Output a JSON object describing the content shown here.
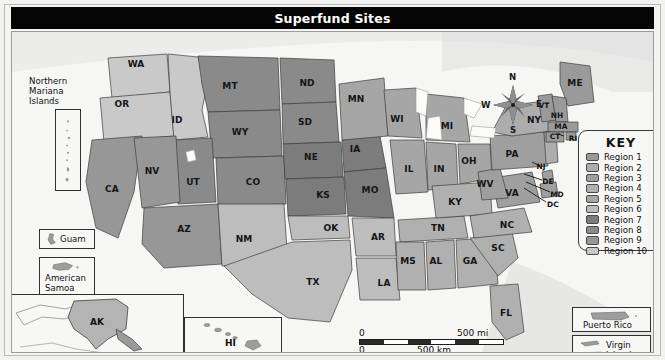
{
  "title": "Superfund Sites",
  "key": {
    "heading": "KEY",
    "entries": [
      {
        "label": "Region 1",
        "color": "#9a9a9a"
      },
      {
        "label": "Region 2",
        "color": "#adadad"
      },
      {
        "label": "Region 3",
        "color": "#9f9f9f"
      },
      {
        "label": "Region 4",
        "color": "#b0b0b0"
      },
      {
        "label": "Region 5",
        "color": "#a6a6a6"
      },
      {
        "label": "Region 6",
        "color": "#bdbdbd"
      },
      {
        "label": "Region 7",
        "color": "#7c7c7c"
      },
      {
        "label": "Region 8",
        "color": "#8a8a8a"
      },
      {
        "label": "Region 9",
        "color": "#979797"
      },
      {
        "label": "Region 10",
        "color": "#c9c9c9"
      }
    ]
  },
  "scale": {
    "miles_zero": "0",
    "miles_max": "500 mi",
    "km_zero": "0",
    "km_max": "500 km",
    "projection_line1": "Lambert Conformal",
    "projection_line2": "Conic Projection"
  },
  "compass": {
    "north": "N",
    "east": "E",
    "south": "S",
    "west": "W"
  },
  "insets": [
    {
      "name": "northern-mariana-islands",
      "label_line1": "Northern",
      "label_line2": "Mariana",
      "label_line3": "Islands"
    },
    {
      "name": "guam",
      "label_line1": "Guam"
    },
    {
      "name": "american-samoa",
      "label_line1": "American",
      "label_line2": "Samoa"
    },
    {
      "name": "alaska",
      "label_line1": "AK"
    },
    {
      "name": "hawaii",
      "label_line1": "HI"
    },
    {
      "name": "puerto-rico",
      "label_line1": "Puerto Rico"
    },
    {
      "name": "virgin-islands",
      "label_line1": "Virgin",
      "label_line2": "Islands"
    }
  ],
  "map": {
    "states": [
      {
        "abbr": "WA",
        "x": 124,
        "y": 32,
        "region": 10
      },
      {
        "abbr": "OR",
        "x": 110,
        "y": 72,
        "region": 10
      },
      {
        "abbr": "ID",
        "x": 165,
        "y": 88,
        "region": 10
      },
      {
        "abbr": "MT",
        "x": 218,
        "y": 54,
        "region": 8
      },
      {
        "abbr": "WY",
        "x": 228,
        "y": 100,
        "region": 8
      },
      {
        "abbr": "ND",
        "x": 295,
        "y": 51,
        "region": 8
      },
      {
        "abbr": "SD",
        "x": 293,
        "y": 90,
        "region": 8
      },
      {
        "abbr": "NE",
        "x": 299,
        "y": 125,
        "region": 7
      },
      {
        "abbr": "KS",
        "x": 311,
        "y": 163,
        "region": 7
      },
      {
        "abbr": "IA",
        "x": 343,
        "y": 117,
        "region": 7
      },
      {
        "abbr": "MO",
        "x": 358,
        "y": 158,
        "region": 7
      },
      {
        "abbr": "MN",
        "x": 344,
        "y": 67,
        "region": 5
      },
      {
        "abbr": "WI",
        "x": 385,
        "y": 87,
        "region": 5
      },
      {
        "abbr": "MI",
        "x": 435,
        "y": 94,
        "region": 5
      },
      {
        "abbr": "IL",
        "x": 397,
        "y": 137,
        "region": 5
      },
      {
        "abbr": "IN",
        "x": 427,
        "y": 137,
        "region": 5
      },
      {
        "abbr": "OH",
        "x": 457,
        "y": 129,
        "region": 5
      },
      {
        "abbr": "NV",
        "x": 140,
        "y": 139,
        "region": 9
      },
      {
        "abbr": "CA",
        "x": 100,
        "y": 157,
        "region": 9
      },
      {
        "abbr": "UT",
        "x": 181,
        "y": 150,
        "region": 8
      },
      {
        "abbr": "CO",
        "x": 241,
        "y": 150,
        "region": 8
      },
      {
        "abbr": "AZ",
        "x": 172,
        "y": 197,
        "region": 9
      },
      {
        "abbr": "NM",
        "x": 232,
        "y": 207,
        "region": 6
      },
      {
        "abbr": "TX",
        "x": 301,
        "y": 250,
        "region": 6
      },
      {
        "abbr": "OK",
        "x": 319,
        "y": 196,
        "region": 6
      },
      {
        "abbr": "AR",
        "x": 366,
        "y": 205,
        "region": 6
      },
      {
        "abbr": "LA",
        "x": 372,
        "y": 251,
        "region": 6
      },
      {
        "abbr": "MS",
        "x": 396,
        "y": 229,
        "region": 4
      },
      {
        "abbr": "AL",
        "x": 424,
        "y": 229,
        "region": 4
      },
      {
        "abbr": "GA",
        "x": 458,
        "y": 229,
        "region": 4
      },
      {
        "abbr": "TN",
        "x": 426,
        "y": 196,
        "region": 4
      },
      {
        "abbr": "KY",
        "x": 443,
        "y": 170,
        "region": 4
      },
      {
        "abbr": "SC",
        "x": 486,
        "y": 216,
        "region": 4
      },
      {
        "abbr": "NC",
        "x": 495,
        "y": 193,
        "region": 4
      },
      {
        "abbr": "FL",
        "x": 494,
        "y": 281,
        "region": 4
      },
      {
        "abbr": "VA",
        "x": 500,
        "y": 161,
        "region": 3
      },
      {
        "abbr": "WV",
        "x": 473,
        "y": 152,
        "region": 3
      },
      {
        "abbr": "PA",
        "x": 500,
        "y": 122,
        "region": 3
      },
      {
        "abbr": "NY",
        "x": 522,
        "y": 88,
        "region": 2
      },
      {
        "abbr": "ME",
        "x": 563,
        "y": 51,
        "region": 1
      },
      {
        "abbr": "VT",
        "x": 532,
        "y": 73,
        "region": 1
      },
      {
        "abbr": "NH",
        "x": 545,
        "y": 83,
        "region": 1
      },
      {
        "abbr": "MA",
        "x": 549,
        "y": 94,
        "region": 1
      },
      {
        "abbr": "CT",
        "x": 543,
        "y": 104,
        "region": 1
      },
      {
        "abbr": "RI",
        "x": 561,
        "y": 106,
        "region": 1
      },
      {
        "abbr": "NJ",
        "x": 529,
        "y": 134,
        "region": 2
      },
      {
        "abbr": "DE",
        "x": 536,
        "y": 149,
        "region": 3
      },
      {
        "abbr": "MD",
        "x": 545,
        "y": 162,
        "region": 3
      },
      {
        "abbr": "DC",
        "x": 541,
        "y": 172,
        "region": 3
      }
    ]
  }
}
